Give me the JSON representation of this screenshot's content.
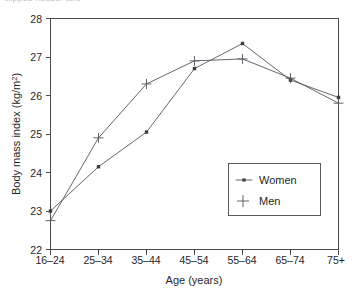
{
  "chart_data": {
    "type": "line",
    "title": "",
    "xlabel": "Age (years)",
    "ylabel": "Body mass index (kg/m²)",
    "ylabel_base": "Body mass index (kg/m",
    "ylabel_sup": "2",
    "ylabel_close": ")",
    "categories": [
      "16–24",
      "25–34",
      "35–44",
      "45–54",
      "55–64",
      "65–74",
      "75+"
    ],
    "ylim": [
      22,
      28
    ],
    "yticks": [
      22,
      23,
      24,
      25,
      26,
      27,
      28
    ],
    "ytick_labels": [
      "22",
      "23",
      "24",
      "25",
      "26",
      "27",
      "28"
    ],
    "grid": false,
    "legend_position": "inside-lower-right",
    "series": [
      {
        "name": "Women",
        "marker": "dot",
        "values": [
          23.0,
          24.15,
          25.05,
          26.7,
          27.35,
          26.4,
          25.95
        ]
      },
      {
        "name": "Men",
        "marker": "plus",
        "values": [
          22.75,
          24.9,
          26.3,
          26.9,
          26.95,
          26.45,
          25.8
        ]
      }
    ]
  },
  "legend": {
    "entries": [
      {
        "label": "Women"
      },
      {
        "label": "Men"
      }
    ]
  },
  "artifact": {
    "top_text": "clipped header text"
  }
}
